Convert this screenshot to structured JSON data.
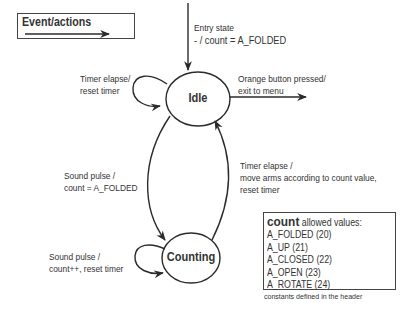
{
  "legend": {
    "title": "Event/actions",
    "icon": "arrow-right-icon"
  },
  "states": [
    {
      "id": "idle",
      "label": "Idle",
      "cx": 198,
      "cy": 99,
      "rx": 32,
      "ry": 27
    },
    {
      "id": "counting",
      "label": "Counting",
      "cx": 191,
      "cy": 258,
      "rx": 29,
      "ry": 25
    }
  ],
  "transitions": {
    "entry": {
      "line1": "Entry state",
      "line2": "- / count  = A_FOLDED"
    },
    "idle_self": {
      "line1": "Timer elapse/",
      "line2": "reset timer"
    },
    "idle_exit": {
      "line1": "Orange button pressed/",
      "line2": "exit to menu"
    },
    "idle_to_counting": {
      "line1": "Sound pulse /",
      "line2": "count  = A_FOLDED"
    },
    "counting_to_idle": {
      "line1": "Timer elapse /",
      "line2": "move arms according to count value,",
      "line3": "reset timer"
    },
    "counting_self": {
      "line1": "Sound pulse /",
      "line2": "count++, reset timer"
    }
  },
  "values_box": {
    "keyword": "count",
    "title_rest": " allowed values:",
    "items": [
      "A_FOLDED (20)",
      "A_UP (21)",
      "A_CLOSED (22)",
      "A_OPEN (23)",
      "A_ROTATE (24)"
    ],
    "footnote": "constants defined in the header"
  },
  "colors": {
    "stroke": "#2b2b2b",
    "text": "#333333",
    "background": "#ffffff"
  }
}
